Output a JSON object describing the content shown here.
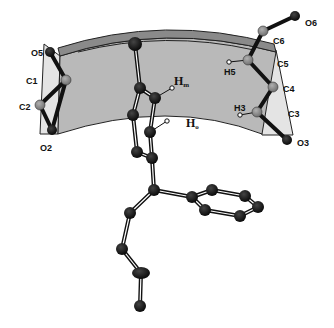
{
  "figure": {
    "colors": {
      "band_fill": "#b9b9b9",
      "band_rim": "#8a8a8a",
      "panel_fill": "#e4e4e4",
      "outline": "#222222",
      "atom_dark": "#111111",
      "atom_gray": "#8f8f8f",
      "background": "#ffffff"
    },
    "labels": {
      "O5": "O5",
      "C1": "C1",
      "C2": "C2",
      "O2": "O2",
      "O6": "O6",
      "C6": "C6",
      "C5": "C5",
      "C4": "C4",
      "C3": "C3",
      "O3": "O3",
      "H5": "H5",
      "H3": "H3",
      "Hm_main": "H",
      "Hm_sub": "m",
      "Ho_main": "H",
      "Ho_sub": "o"
    }
  }
}
